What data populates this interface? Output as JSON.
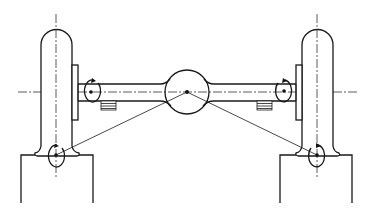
{
  "diagram": {
    "title": "",
    "colors": {
      "line": "#1a1a1a",
      "background": "#ffffff"
    },
    "components": [
      {
        "id": "left-wheel",
        "label": ""
      },
      {
        "id": "right-wheel",
        "label": ""
      },
      {
        "id": "left-hub-flange",
        "label": ""
      },
      {
        "id": "right-hub-flange",
        "label": ""
      },
      {
        "id": "axle-tube",
        "label": ""
      },
      {
        "id": "differential-housing",
        "label": ""
      },
      {
        "id": "left-spring-pad",
        "label": ""
      },
      {
        "id": "right-spring-pad",
        "label": ""
      },
      {
        "id": "left-ground-block",
        "label": ""
      },
      {
        "id": "right-ground-block",
        "label": ""
      },
      {
        "id": "left-hub-rotation-arrow",
        "label": ""
      },
      {
        "id": "right-hub-rotation-arrow",
        "label": ""
      },
      {
        "id": "left-contact-rotation-arrow",
        "label": ""
      },
      {
        "id": "right-contact-rotation-arrow",
        "label": ""
      },
      {
        "id": "left-diagonal-link",
        "label": ""
      },
      {
        "id": "right-diagonal-link",
        "label": ""
      }
    ],
    "text_labels": []
  }
}
